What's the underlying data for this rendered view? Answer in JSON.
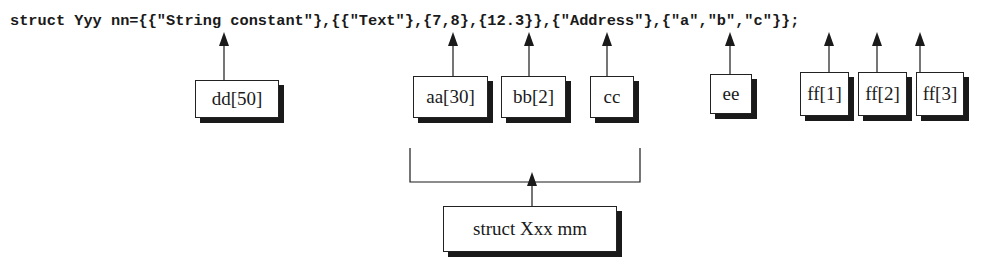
{
  "code_line": "struct Yyy nn={{\"String constant\"},{{\"Text\"},{7,8},{12.3}},{\"Address\"},{\"a\",\"b\",\"c\"}};",
  "boxes": [
    {
      "label": "dd[50]"
    },
    {
      "label": "aa[30]"
    },
    {
      "label": "bb[2]"
    },
    {
      "label": "cc"
    },
    {
      "label": "ee"
    },
    {
      "label": "ff[1]"
    },
    {
      "label": "ff[2]"
    },
    {
      "label": "ff[3]"
    }
  ],
  "group_box": {
    "label": "struct Xxx mm"
  }
}
